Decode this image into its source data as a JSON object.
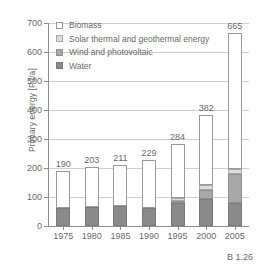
{
  "chart_data": {
    "type": "bar",
    "stacked": true,
    "title": "",
    "xlabel": "",
    "ylabel": "Primary energy [PJ/a]",
    "categories": [
      "1975",
      "1980",
      "1985",
      "1990",
      "1995",
      "2000",
      "2005"
    ],
    "ylim": [
      0,
      700
    ],
    "yticks": [
      0,
      100,
      200,
      300,
      400,
      500,
      600,
      700
    ],
    "grid": true,
    "legend_position": "top-left",
    "series": [
      {
        "name": "Water",
        "key": "water",
        "color": "#8a8a8a",
        "values": [
          62,
          66,
          68,
          62,
          78,
          92,
          78
        ]
      },
      {
        "name": "Wind and photovoltaic",
        "key": "wind",
        "color": "#a8a8a8",
        "values": [
          0,
          0,
          0,
          0,
          10,
          33,
          102
        ]
      },
      {
        "name": "Solar thermal and geothermal energy",
        "key": "solar",
        "color": "#dcdcdc",
        "values": [
          0,
          0,
          0,
          0,
          7,
          15,
          17
        ]
      },
      {
        "name": "Biomass",
        "key": "biomass",
        "color": "#ffffff",
        "values": [
          128,
          137,
          143,
          167,
          189,
          242,
          468
        ]
      }
    ],
    "totals": [
      190,
      203,
      211,
      229,
      284,
      382,
      665
    ],
    "data_labels": [
      "190",
      "203",
      "211",
      "229",
      "284",
      "382",
      "665"
    ]
  },
  "legend": {
    "items": [
      {
        "label": "Biomass",
        "key": "biomass"
      },
      {
        "label": "Solar thermal and geothermal energy",
        "key": "solar"
      },
      {
        "label": "Wind and photovoltaic",
        "key": "wind"
      },
      {
        "label": "Water",
        "key": "water"
      }
    ]
  },
  "caption": {
    "text": "B 1.26"
  },
  "colors": {
    "axis": "#8d8d8d",
    "grid": "#cfcfcf",
    "text": "#6a6a6a",
    "biomass": "#ffffff",
    "solar": "#dcdcdc",
    "wind": "#a8a8a8",
    "water": "#8a8a8a"
  }
}
